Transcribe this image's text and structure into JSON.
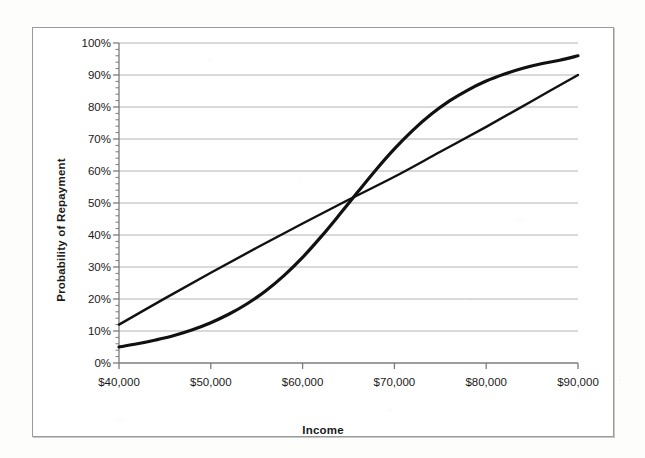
{
  "chart_data": {
    "type": "line",
    "title": "",
    "xlabel": "Income",
    "ylabel": "Probability of Repayment",
    "xlim": [
      40000,
      90000
    ],
    "ylim": [
      0,
      1.0
    ],
    "grid": true,
    "legend_position": "none",
    "x_tick_labels": [
      "$40,000",
      "$50,000",
      "$60,000",
      "$70,000",
      "$80,000",
      "$90,000"
    ],
    "x_ticks": [
      40000,
      50000,
      60000,
      70000,
      80000,
      90000
    ],
    "y_tick_labels": [
      "0%",
      "10%",
      "20%",
      "30%",
      "40%",
      "50%",
      "60%",
      "70%",
      "80%",
      "90%",
      "100%"
    ],
    "y_ticks": [
      0,
      10,
      20,
      30,
      40,
      50,
      60,
      70,
      80,
      90,
      100
    ],
    "y_minor_tick_interval": 2,
    "series": [
      {
        "name": "logistic-curve",
        "style": "solid",
        "color": "#111111",
        "width": 3.2,
        "x": [
          40000,
          42000,
          44000,
          46000,
          48000,
          50000,
          52000,
          54000,
          56000,
          58000,
          60000,
          62000,
          64000,
          66000,
          68000,
          70000,
          72000,
          74000,
          76000,
          78000,
          80000,
          82000,
          84000,
          86000,
          88000,
          90000
        ],
        "values": [
          5,
          6,
          7.2,
          8.6,
          10.4,
          12.6,
          15.3,
          18.6,
          22.6,
          27.4,
          33.0,
          39.4,
          46.3,
          53.4,
          60.4,
          66.9,
          72.7,
          77.7,
          81.9,
          85.3,
          88.1,
          90.3,
          92.1,
          93.5,
          94.6,
          96.0
        ]
      },
      {
        "name": "straight-line",
        "style": "solid",
        "color": "#111111",
        "width": 2.4,
        "x": [
          40000,
          45000,
          50000,
          55000,
          60000,
          65000,
          70000,
          75000,
          80000,
          85000,
          90000
        ],
        "values": [
          12.0,
          20.2,
          28.2,
          36.0,
          43.6,
          51.0,
          58.2,
          66.0,
          73.8,
          81.9,
          90.0
        ]
      }
    ],
    "annotations": [
      {
        "name": "crossing-point",
        "x": 61500,
        "y": 47
      }
    ],
    "colors": {
      "gridline": "#b4b4b4",
      "axis": "#7c7c7c",
      "line": "#111111",
      "frame": "#9a9a9a",
      "background": "#ffffff",
      "text": "#1a1a1a"
    }
  }
}
